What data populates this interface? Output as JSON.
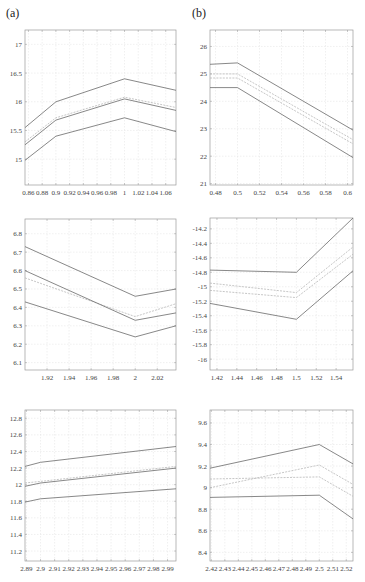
{
  "panel_labels": {
    "a": "(a)",
    "b": "(b)"
  },
  "colors": {
    "bound": "#6a6a6a",
    "mid": "#b8b8b8",
    "grid": "#e6e6e6",
    "axis": "#9a9a9a"
  },
  "chart_data": [
    {
      "type": "line",
      "panel": "a-top",
      "box": [
        25,
        30,
        176,
        185
      ],
      "xlim": [
        0.855,
        1.075
      ],
      "ylim": [
        14.55,
        17.25
      ],
      "xticks": [
        0.86,
        0.88,
        0.9,
        0.92,
        0.94,
        0.96,
        0.98,
        1,
        1.02,
        1.04,
        1.06
      ],
      "xtick_labels": [
        "0.86",
        "0.88",
        "0.9",
        "0.92",
        "0.94",
        "0.96",
        "0.98",
        "1",
        "1.02",
        "1.04",
        "1.06"
      ],
      "yticks": [
        15,
        15.5,
        16,
        16.5,
        17
      ],
      "ytick_labels": [
        "15",
        "15.5",
        "16",
        "16.5",
        "17"
      ],
      "series": [
        {
          "name": "upper",
          "style": "bound",
          "x": [
            0.855,
            0.9,
            1.0,
            1.075
          ],
          "y": [
            15.55,
            16.0,
            16.4,
            16.2
          ]
        },
        {
          "name": "mid-upper",
          "style": "mid",
          "x": [
            0.855,
            0.9,
            1.0,
            1.075
          ],
          "y": [
            15.3,
            15.72,
            16.08,
            15.9
          ]
        },
        {
          "name": "mid",
          "style": "bound",
          "x": [
            0.855,
            0.9,
            1.0,
            1.075
          ],
          "y": [
            15.25,
            15.68,
            16.05,
            15.85
          ]
        },
        {
          "name": "lower",
          "style": "bound",
          "x": [
            0.855,
            0.9,
            1.0,
            1.075
          ],
          "y": [
            14.98,
            15.4,
            15.72,
            15.48
          ]
        }
      ]
    },
    {
      "type": "line",
      "panel": "b-top",
      "box": [
        210,
        30,
        353,
        185
      ],
      "xlim": [
        0.475,
        0.605
      ],
      "ylim": [
        20.95,
        26.6
      ],
      "xticks": [
        0.48,
        0.5,
        0.52,
        0.54,
        0.56,
        0.58,
        0.6
      ],
      "xtick_labels": [
        "0.48",
        "0.5",
        "0.52",
        "0.54",
        "0.56",
        "0.58",
        "0.6"
      ],
      "yticks": [
        21,
        22,
        23,
        24,
        25,
        26
      ],
      "ytick_labels": [
        "21",
        "22",
        "23",
        "24",
        "25",
        "26"
      ],
      "series": [
        {
          "name": "upper",
          "style": "bound",
          "x": [
            0.475,
            0.5,
            0.605
          ],
          "y": [
            25.35,
            25.4,
            22.95
          ]
        },
        {
          "name": "mid-upper",
          "style": "mid",
          "x": [
            0.475,
            0.5,
            0.605
          ],
          "y": [
            25.0,
            25.0,
            22.6
          ]
        },
        {
          "name": "mid-lower",
          "style": "mid",
          "x": [
            0.475,
            0.5,
            0.605
          ],
          "y": [
            24.85,
            24.85,
            22.45
          ]
        },
        {
          "name": "lower",
          "style": "bound",
          "x": [
            0.475,
            0.5,
            0.605
          ],
          "y": [
            24.5,
            24.5,
            21.95
          ]
        }
      ]
    },
    {
      "type": "line",
      "panel": "a-middle",
      "box": [
        25,
        219,
        176,
        370
      ],
      "xlim": [
        1.9,
        2.037
      ],
      "ylim": [
        6.06,
        6.88
      ],
      "xticks": [
        1.92,
        1.94,
        1.96,
        1.98,
        2,
        2.02
      ],
      "xtick_labels": [
        "1.92",
        "1.94",
        "1.96",
        "1.98",
        "2",
        "2.02"
      ],
      "yticks": [
        6.1,
        6.2,
        6.3,
        6.4,
        6.5,
        6.6,
        6.7,
        6.8
      ],
      "ytick_labels": [
        "6.1",
        "6.2",
        "6.3",
        "6.4",
        "6.5",
        "6.6",
        "6.7",
        "6.8"
      ],
      "series": [
        {
          "name": "upper",
          "style": "bound",
          "x": [
            1.9,
            2.0,
            2.037
          ],
          "y": [
            6.73,
            6.46,
            6.5
          ]
        },
        {
          "name": "mid-upper",
          "style": "mid",
          "x": [
            1.9,
            2.0,
            2.037
          ],
          "y": [
            6.56,
            6.35,
            6.42
          ]
        },
        {
          "name": "mid",
          "style": "bound",
          "x": [
            1.9,
            2.0,
            2.037
          ],
          "y": [
            6.6,
            6.33,
            6.37
          ]
        },
        {
          "name": "lower",
          "style": "bound",
          "x": [
            1.9,
            2.0,
            2.037
          ],
          "y": [
            6.43,
            6.24,
            6.3
          ]
        }
      ]
    },
    {
      "type": "line",
      "panel": "b-middle",
      "box": [
        210,
        218,
        353,
        370
      ],
      "xlim": [
        1.413,
        1.557
      ],
      "ylim": [
        -16.15,
        -14.05
      ],
      "xticks": [
        1.42,
        1.44,
        1.46,
        1.48,
        1.5,
        1.52,
        1.54
      ],
      "xtick_labels": [
        "1.42",
        "1.44",
        "1.46",
        "1.48",
        "1.5",
        "1.52",
        "1.54"
      ],
      "yticks": [
        -16,
        -15.8,
        -15.6,
        -15.4,
        -15.2,
        -15,
        -14.8,
        -14.6,
        -14.4,
        -14.2
      ],
      "ytick_labels": [
        "-16",
        "-15.8",
        "-15.6",
        "-15.4",
        "-15.2",
        "-15",
        "-14.8",
        "-14.6",
        "-14.4",
        "-14.2"
      ],
      "series": [
        {
          "name": "upper",
          "style": "bound",
          "x": [
            1.413,
            1.5,
            1.557
          ],
          "y": [
            -14.77,
            -14.8,
            -14.05
          ]
        },
        {
          "name": "mid-upper",
          "style": "mid",
          "x": [
            1.413,
            1.5,
            1.557
          ],
          "y": [
            -14.95,
            -15.08,
            -14.45
          ]
        },
        {
          "name": "mid-lower",
          "style": "mid",
          "x": [
            1.413,
            1.5,
            1.557
          ],
          "y": [
            -15.05,
            -15.15,
            -14.55
          ]
        },
        {
          "name": "lower",
          "style": "bound",
          "x": [
            1.413,
            1.5,
            1.557
          ],
          "y": [
            -15.23,
            -15.45,
            -14.78
          ]
        }
      ]
    },
    {
      "type": "line",
      "panel": "a-bottom",
      "box": [
        25,
        410,
        176,
        561
      ],
      "xlim": [
        2.889,
        2.996
      ],
      "ylim": [
        11.08,
        12.9
      ],
      "xticks": [
        2.89,
        2.9,
        2.91,
        2.92,
        2.93,
        2.94,
        2.95,
        2.96,
        2.97,
        2.98,
        2.99
      ],
      "xtick_labels": [
        "2.89",
        "2.9",
        "2.91",
        "2.92",
        "2.93",
        "2.94",
        "2.95",
        "2.96",
        "2.97",
        "2.98",
        "2.99"
      ],
      "yticks": [
        11.2,
        11.4,
        11.6,
        11.8,
        12,
        12.2,
        12.4,
        12.6,
        12.8
      ],
      "ytick_labels": [
        "11.2",
        "11.4",
        "11.6",
        "11.8",
        "12",
        "12.2",
        "12.4",
        "12.6",
        "12.8"
      ],
      "series": [
        {
          "name": "upper",
          "style": "bound",
          "x": [
            2.889,
            2.9,
            2.996
          ],
          "y": [
            12.22,
            12.27,
            12.46
          ]
        },
        {
          "name": "mid-upper",
          "style": "mid",
          "x": [
            2.889,
            2.9,
            2.996
          ],
          "y": [
            12.02,
            12.04,
            12.22
          ]
        },
        {
          "name": "mid",
          "style": "bound",
          "x": [
            2.889,
            2.9,
            2.996
          ],
          "y": [
            11.98,
            12.02,
            12.2
          ]
        },
        {
          "name": "lower",
          "style": "bound",
          "x": [
            2.889,
            2.9,
            2.996
          ],
          "y": [
            11.79,
            11.83,
            11.95
          ]
        }
      ]
    },
    {
      "type": "line",
      "panel": "b-bottom",
      "box": [
        210,
        410,
        353,
        561
      ],
      "xlim": [
        2.419,
        2.525
      ],
      "ylim": [
        8.32,
        9.72
      ],
      "xticks": [
        2.42,
        2.43,
        2.44,
        2.45,
        2.46,
        2.47,
        2.48,
        2.49,
        2.5,
        2.51,
        2.52
      ],
      "xtick_labels": [
        "2.42",
        "2.43",
        "2.44",
        "2.45",
        "2.46",
        "2.47",
        "2.48",
        "2.49",
        "2.5",
        "2.51",
        "2.52"
      ],
      "yticks": [
        8.4,
        8.6,
        8.8,
        9,
        9.2,
        9.4,
        9.6
      ],
      "ytick_labels": [
        "8.4",
        "8.6",
        "8.8",
        "9",
        "9.2",
        "9.4",
        "9.6"
      ],
      "series": [
        {
          "name": "upper",
          "style": "bound",
          "x": [
            2.419,
            2.5,
            2.525
          ],
          "y": [
            9.18,
            9.4,
            9.22
          ]
        },
        {
          "name": "mid-upper",
          "style": "mid",
          "x": [
            2.419,
            2.5,
            2.525
          ],
          "y": [
            9.0,
            9.21,
            9.03
          ]
        },
        {
          "name": "mid-lower",
          "style": "mid",
          "x": [
            2.419,
            2.5,
            2.525
          ],
          "y": [
            9.08,
            9.1,
            8.92
          ]
        },
        {
          "name": "lower",
          "style": "bound",
          "x": [
            2.419,
            2.5,
            2.525
          ],
          "y": [
            8.91,
            8.93,
            8.71
          ]
        }
      ]
    }
  ]
}
